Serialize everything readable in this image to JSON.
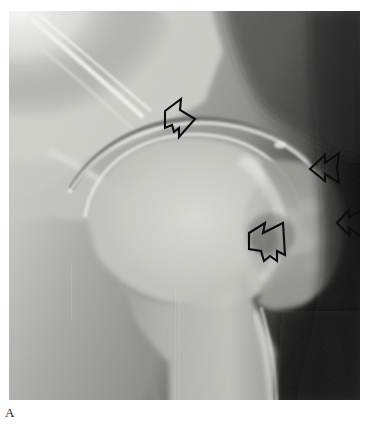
{
  "figure": {
    "label": "A",
    "modality": "radiograph",
    "body_part": "hip joint (anteroposterior projection)",
    "caption_position": "below-left"
  },
  "image": {
    "alt_text": "Anteroposterior radiograph of the hip showing the femoral head, joint space, greater trochanter and proximal femoral shaft",
    "frame": {
      "x": 9,
      "y": 11,
      "width": 351,
      "height": 389
    },
    "background_color": "#ffffff",
    "film_base_color": "#8f8f8f",
    "bright_bone_color": "#e8e8e6",
    "dark_soft_tissue_color": "#1a1a1a",
    "mid_tone_color": "#a6a6a4"
  },
  "annotations": {
    "arrow_color": "#0d0d0d",
    "arrow_fill": "none",
    "arrow_stroke_width": 2.1,
    "items": [
      {
        "id": "arrow-acetabular-roof",
        "name": "arrow-1-superior-joint-space",
        "direction": "right",
        "points_to": "superior acetabular margin / joint space narrowing",
        "x": 163,
        "y": 99,
        "width": 33,
        "height": 40
      },
      {
        "id": "arrow-greater-trochanter-superior",
        "name": "arrow-2-upper-lateral",
        "direction": "left",
        "points_to": "superolateral femoral head-neck junction",
        "x": 309,
        "y": 151,
        "width": 32,
        "height": 36
      },
      {
        "id": "arrow-lateral-cortex",
        "name": "arrow-3-lateral-margin",
        "direction": "left",
        "points_to": "lateral cortical margin of greater trochanter",
        "x": 336,
        "y": 207,
        "width": 30,
        "height": 38
      },
      {
        "id": "arrow-subchondral-lucency",
        "name": "arrow-4-subchondral-lesion",
        "direction": "up-right",
        "points_to": "subchondral lucent lesion in femoral head",
        "x": 247,
        "y": 221,
        "width": 39,
        "height": 42
      }
    ]
  }
}
